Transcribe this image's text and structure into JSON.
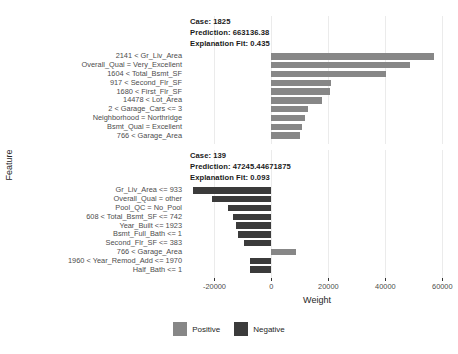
{
  "chart_data": {
    "type": "bar",
    "title": "",
    "xlabel": "Weight",
    "ylabel": "Feature",
    "orientation": "horizontal",
    "xlim": [
      -30000,
      62000
    ],
    "xticks": [
      -20000,
      0,
      20000,
      40000,
      60000
    ],
    "xticklabels": [
      "-20000",
      "0",
      "20000",
      "40000",
      "60000"
    ],
    "grid": true,
    "legend": {
      "position": "bottom",
      "entries": [
        {
          "label": "Positive",
          "color": "#878787"
        },
        {
          "label": "Negative",
          "color": "#3b3b3b"
        }
      ]
    },
    "panels": [
      {
        "case_label": "Case: 1825",
        "prediction_label": "Prediction: 663136.38",
        "fit_label": "Explanation Fit: 0.435",
        "case": "1825",
        "prediction": 663136.38,
        "explanation_fit": 0.435,
        "categories": [
          "2141 < Gr_Liv_Area",
          "Overall_Qual = Very_Excellent",
          "1604 < Total_Bsmt_SF",
          "917 < Second_Flr_SF",
          "1680 < First_Flr_SF",
          "14478 < Lot_Area",
          "2 < Garage_Cars <= 3",
          "Neighborhood = Northridge",
          "Bsmt_Qual = Excellent",
          "766 < Garage_Area"
        ],
        "values": [
          57200,
          48600,
          40100,
          21000,
          20400,
          17600,
          12800,
          11800,
          10800,
          10100
        ]
      },
      {
        "case_label": "Case: 139",
        "prediction_label": "Prediction: 47245.44671875",
        "fit_label": "Explanation Fit: 0.093",
        "case": "139",
        "prediction": 47245.44671875,
        "explanation_fit": 0.093,
        "categories": [
          "Gr_Liv_Area <= 933",
          "Overall_Qual = other",
          "Pool_QC = No_Pool",
          "608 < Total_Bsmt_SF <= 742",
          "Year_Built <= 1923",
          "Bsmt_Full_Bath <= 1",
          "Second_Flr_SF <= 383",
          "766 < Garage_Area",
          "1960 < Year_Remod_Add <= 1970",
          "Half_Bath <= 1"
        ],
        "values": [
          -27600,
          -21000,
          -15200,
          -13600,
          -12600,
          -11600,
          -9600,
          8600,
          -7600,
          -7400
        ]
      }
    ]
  }
}
